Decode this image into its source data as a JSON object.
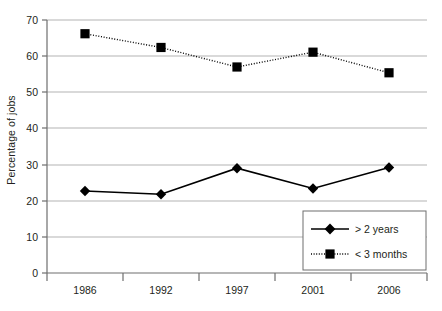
{
  "chart_data": {
    "type": "line",
    "title": "",
    "xlabel": "",
    "ylabel": "Percentage of jobs",
    "categories": [
      "1986",
      "1992",
      "1997",
      "2001",
      "2006"
    ],
    "ylim": [
      0,
      70
    ],
    "yticks": [
      0,
      10,
      20,
      30,
      40,
      50,
      60,
      70
    ],
    "ytick_labels": [
      "0",
      "10",
      "20",
      "30",
      "40",
      "50",
      "60",
      "70"
    ],
    "grid": true,
    "grid_axis": "y",
    "legend_position": "lower-right",
    "series": [
      {
        "name": "> 2 years",
        "marker": "diamond",
        "line_style": "solid",
        "color": "#000000",
        "values": [
          22.7,
          21.8,
          29.0,
          23.4,
          29.2
        ]
      },
      {
        "name": "< 3 months",
        "marker": "square",
        "line_style": "dotted",
        "color": "#000000",
        "values": [
          66.2,
          62.4,
          57.0,
          61.1,
          55.4
        ]
      }
    ]
  },
  "legend": {
    "items": [
      {
        "label": "> 2 years"
      },
      {
        "label": "< 3 months"
      }
    ]
  },
  "colors": {
    "axis": "#231f20",
    "grid": "#b3b3b3",
    "series": "#000000",
    "background": "#ffffff"
  }
}
